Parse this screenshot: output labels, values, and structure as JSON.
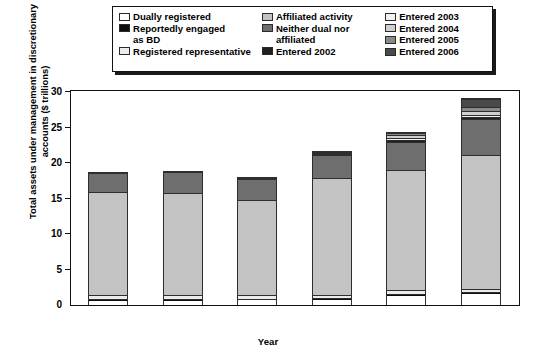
{
  "chart_data": {
    "type": "bar",
    "subtype": "stacked-vertical",
    "title": "",
    "xlabel": "Year",
    "ylabel": "Total assets under management in discretionary accounts ($ trillions)",
    "categories": [
      "2001",
      "2002",
      "2003",
      "2004",
      "2005",
      "2006"
    ],
    "ylim": [
      0,
      30
    ],
    "yticks": [
      0,
      5,
      10,
      15,
      20,
      25,
      30
    ],
    "grid": false,
    "legend_position": "top",
    "series": [
      {
        "name": "Dually registered",
        "color": "#ffffff",
        "values": [
          0.6,
          0.6,
          0.7,
          0.7,
          1.3,
          1.5
        ]
      },
      {
        "name": "Reportedly engaged as BD",
        "color": "#0d0d0d",
        "values": [
          0.2,
          0.2,
          0.2,
          0.3,
          0.3,
          0.3
        ]
      },
      {
        "name": "Registered representative",
        "color": "#ececec",
        "values": [
          0.6,
          0.6,
          0.5,
          0.4,
          0.5,
          0.5
        ]
      },
      {
        "name": "Affiliated activity",
        "color": "#c3c3c3",
        "values": [
          14.6,
          14.5,
          13.6,
          16.6,
          17.0,
          19.0
        ]
      },
      {
        "name": "Neither dual nor affiliated",
        "color": "#6e6e6e",
        "values": [
          2.7,
          3.0,
          2.9,
          3.2,
          4.0,
          5.0
        ]
      },
      {
        "name": "Entered 2002",
        "color": "#1f1f1f",
        "values": [
          0.0,
          0.0,
          0.1,
          0.2,
          0.25,
          0.25
        ]
      },
      {
        "name": "Entered 2003",
        "color": "#f2f2f2",
        "values": [
          0.0,
          0.0,
          0.0,
          0.15,
          0.35,
          0.4
        ]
      },
      {
        "name": "Entered 2004",
        "color": "#cfcfcf",
        "values": [
          0.0,
          0.0,
          0.0,
          0.15,
          0.35,
          0.5
        ]
      },
      {
        "name": "Entered 2005",
        "color": "#8a8a8a",
        "values": [
          0.0,
          0.0,
          0.0,
          0.0,
          0.35,
          0.6
        ]
      },
      {
        "name": "Entered 2006",
        "color": "#4a4a4a",
        "values": [
          0.0,
          0.0,
          0.0,
          0.0,
          0.0,
          1.05
        ]
      }
    ],
    "totals": [
      18.7,
      18.9,
      18.0,
      21.7,
      24.4,
      29.1
    ]
  },
  "legend": {
    "columns": [
      {
        "entries": [
          {
            "label": "Dually registered",
            "label_cont": "",
            "color": "#ffffff"
          },
          {
            "label": "Reportedly engaged",
            "label_cont": "as BD",
            "color": "#0d0d0d"
          },
          {
            "label": "Registered representative",
            "label_cont": "",
            "color": "#ececec"
          }
        ]
      },
      {
        "entries": [
          {
            "label": "Affiliated activity",
            "label_cont": "",
            "color": "#c3c3c3"
          },
          {
            "label": "Neither dual nor",
            "label_cont": "affiliated",
            "color": "#6e6e6e"
          },
          {
            "label": "Entered 2002",
            "label_cont": "",
            "color": "#1f1f1f"
          }
        ]
      },
      {
        "entries": [
          {
            "label": "Entered 2003",
            "label_cont": "",
            "color": "#f2f2f2"
          },
          {
            "label": "Entered 2004",
            "label_cont": "",
            "color": "#cfcfcf"
          },
          {
            "label": "Entered 2005",
            "label_cont": "",
            "color": "#8a8a8a"
          },
          {
            "label": "Entered 2006",
            "label_cont": "",
            "color": "#4a4a4a"
          }
        ]
      }
    ]
  },
  "axes": {
    "y_title": "Total assets under management in discretionary accounts ($ trillions)",
    "x_title": "Year",
    "y_tick_labels": [
      "0",
      "5",
      "10",
      "15",
      "20",
      "25",
      "30"
    ],
    "x_tick_labels": [
      "2001",
      "2002",
      "2003",
      "2004",
      "2005",
      "2006"
    ]
  },
  "colors": {
    "axis": "#111111",
    "background": "#ffffff",
    "bar_outline": "#2e2e2e"
  }
}
